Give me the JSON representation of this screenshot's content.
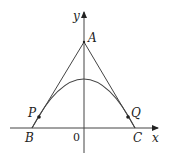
{
  "diagram": {
    "axes": {
      "x_label": "x",
      "y_label": "y",
      "origin_label": "0"
    },
    "points": {
      "A": "A",
      "B": "B",
      "C": "C",
      "P": "P",
      "Q": "Q"
    },
    "colors": {
      "line": "#333333",
      "background": "#ffffff"
    }
  }
}
